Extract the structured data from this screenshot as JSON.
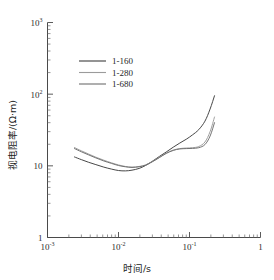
{
  "chart_data": {
    "type": "line",
    "title": "",
    "xlabel": "时间/s",
    "ylabel": "视电阻率/(Ω·m)",
    "xscale": "log",
    "yscale": "log",
    "xlim": [
      0.001,
      1
    ],
    "ylim": [
      1,
      1000
    ],
    "grid": false,
    "legend_position": "upper-left-inside",
    "xticklabels": [
      "10⁻³",
      "10⁻²",
      "10⁻¹",
      "1"
    ],
    "xtickvalues": [
      0.001,
      0.01,
      0.1,
      1
    ],
    "yticklabels": [
      "1",
      "10",
      "10²",
      "10³"
    ],
    "ytickvalues": [
      1,
      10,
      100,
      1000
    ],
    "series": [
      {
        "name": "1-160",
        "color": "#3d3d3d",
        "x": [
          0.0024,
          0.003,
          0.0038,
          0.0048,
          0.0062,
          0.008,
          0.01,
          0.0125,
          0.0155,
          0.0195,
          0.024,
          0.03,
          0.038,
          0.047,
          0.059,
          0.073,
          0.09,
          0.11,
          0.135,
          0.165,
          0.195,
          0.225
        ],
        "y": [
          13.3,
          12.2,
          11.2,
          10.4,
          9.6,
          9.0,
          8.6,
          8.5,
          8.7,
          9.2,
          10.1,
          11.6,
          13.6,
          15.6,
          18.2,
          20.8,
          23.5,
          27.0,
          32.0,
          42.0,
          62.0,
          95.0
        ]
      },
      {
        "name": "1-280",
        "color": "#9b9b9b",
        "x": [
          0.0024,
          0.003,
          0.0038,
          0.0048,
          0.0062,
          0.008,
          0.01,
          0.0125,
          0.0155,
          0.0195,
          0.024,
          0.03,
          0.038,
          0.047,
          0.059,
          0.073,
          0.09,
          0.11,
          0.135,
          0.165,
          0.195,
          0.225
        ],
        "y": [
          18.0,
          16.2,
          14.6,
          13.2,
          12.0,
          11.0,
          10.3,
          9.8,
          9.6,
          9.8,
          10.3,
          11.5,
          13.2,
          15.0,
          16.6,
          17.4,
          17.7,
          17.9,
          18.6,
          21.5,
          30.0,
          48.0
        ]
      },
      {
        "name": "1-680",
        "color": "#6d6d6d",
        "x": [
          0.0024,
          0.003,
          0.0038,
          0.0048,
          0.0062,
          0.008,
          0.01,
          0.0125,
          0.0155,
          0.0195,
          0.024,
          0.03,
          0.038,
          0.047,
          0.059,
          0.073,
          0.09,
          0.11,
          0.135,
          0.165,
          0.195,
          0.225
        ],
        "y": [
          17.4,
          15.7,
          14.2,
          12.9,
          11.7,
          10.8,
          10.1,
          9.7,
          9.5,
          9.7,
          10.2,
          11.4,
          13.1,
          14.9,
          16.4,
          17.2,
          17.4,
          17.5,
          17.9,
          19.8,
          26.0,
          40.0
        ]
      }
    ]
  },
  "legend": {
    "items": [
      {
        "label": "1-160",
        "color": "#3d3d3d"
      },
      {
        "label": "1-280",
        "color": "#9b9b9b"
      },
      {
        "label": "1-680",
        "color": "#6d6d6d"
      }
    ]
  },
  "axes": {
    "x_title": "时间/s",
    "y_title": "视电阻率/(Ω·m)",
    "x_ticks": [
      {
        "value": 0.001,
        "mantissa": "10",
        "exponent": "-3"
      },
      {
        "value": 0.01,
        "mantissa": "10",
        "exponent": "-2"
      },
      {
        "value": 0.1,
        "mantissa": "10",
        "exponent": "-1"
      },
      {
        "value": 1,
        "mantissa": "1",
        "exponent": ""
      }
    ],
    "y_ticks": [
      {
        "value": 1,
        "mantissa": "1",
        "exponent": ""
      },
      {
        "value": 10,
        "mantissa": "10",
        "exponent": ""
      },
      {
        "value": 100,
        "mantissa": "10",
        "exponent": "2"
      },
      {
        "value": 1000,
        "mantissa": "10",
        "exponent": "3"
      }
    ]
  },
  "colors": {
    "axis": "#4a4a4a",
    "text": "#1a1a1a",
    "background": "#ffffff"
  }
}
